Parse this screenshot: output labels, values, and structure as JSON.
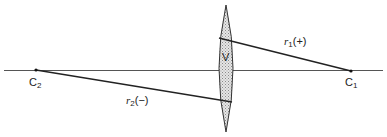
{
  "diagram": {
    "type": "thick lens radii of curvature sign convention",
    "colors": {
      "line": "#222222",
      "axis": "#555555",
      "lens_fill": "#d9d9d9",
      "lens_stroke": "#333333",
      "background": "#ffffff"
    },
    "labels": {
      "c2_base": "C",
      "c2_sub": "2",
      "c1_base": "C",
      "c1_sub": "1",
      "vertex": "V",
      "r1_base": "r",
      "r1_sub": "1",
      "r1_sign": "(+)",
      "r2_base": "r",
      "r2_sub": "2",
      "r2_sign": "(−)"
    },
    "points": {
      "C2": [
        36,
        70
      ],
      "C1": [
        351,
        71
      ]
    },
    "lens": {
      "center_x": 226,
      "top_y": 5,
      "bottom_y": 132,
      "half_width": 7
    },
    "axis": {
      "x1": 4,
      "x2": 383,
      "y": 70.5
    }
  }
}
